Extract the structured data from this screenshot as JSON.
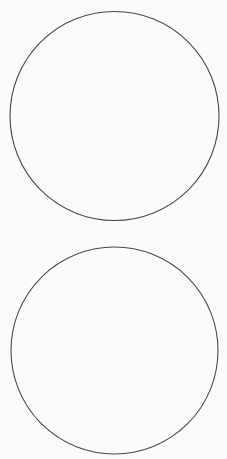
{
  "page": {
    "background": "#fbfbf9",
    "stroke_color": "#4a4a4a",
    "stroke_width": 1.1
  },
  "shapes": [
    {
      "type": "circle",
      "cx": 114.5,
      "cy": 116,
      "r": 104.5
    },
    {
      "type": "circle",
      "cx": 114.5,
      "cy": 350.5,
      "r": 103.5
    }
  ]
}
